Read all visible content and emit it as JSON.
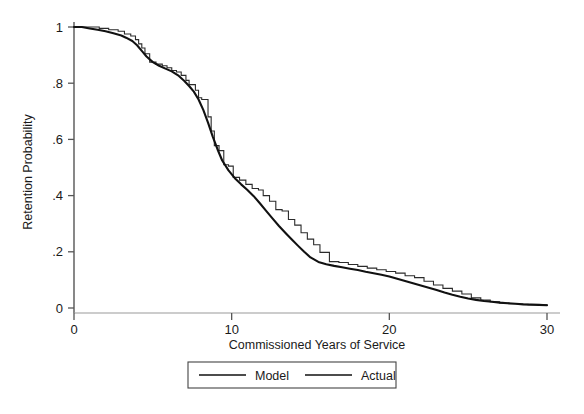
{
  "chart_data": {
    "type": "line",
    "title": "",
    "subtitle": "",
    "xlabel": "Commissioned Years of Service",
    "ylabel": "Retention Probability",
    "xlim": [
      0,
      30
    ],
    "ylim": [
      0,
      1
    ],
    "xticks": [
      0,
      10,
      20,
      30
    ],
    "xticklabels": [
      "0",
      "10",
      "20",
      "30"
    ],
    "yticks": [
      0,
      0.2,
      0.4,
      0.6,
      0.8,
      1
    ],
    "yticklabels": [
      "0",
      ".2",
      ".4",
      ".6",
      ".8",
      "1"
    ],
    "grid": false,
    "legend_position": "below-axes",
    "line_color": "#1a1a1a",
    "legend": [
      {
        "name": "Model",
        "color": "#1a1a1a"
      },
      {
        "name": "Actual",
        "color": "#1a1a1a"
      }
    ],
    "series": [
      {
        "name": "Model",
        "drawstyle": "smooth",
        "x": [
          0.0,
          0.5,
          1.0,
          1.5,
          2.0,
          2.5,
          3.0,
          3.3,
          3.7,
          4.0,
          4.3,
          4.6,
          5.0,
          5.4,
          5.8,
          6.2,
          6.6,
          7.0,
          7.3,
          7.6,
          7.9,
          8.2,
          8.5,
          8.8,
          9.1,
          9.4,
          9.8,
          10.2,
          10.6,
          11.0,
          11.4,
          11.8,
          12.2,
          12.6,
          13.0,
          13.4,
          13.8,
          14.2,
          14.6,
          15.0,
          15.5,
          16.0,
          16.5,
          17.0,
          17.5,
          18.0,
          18.5,
          19.0,
          19.5,
          20.0,
          20.5,
          21.0,
          21.5,
          22.0,
          22.5,
          23.0,
          23.5,
          24.0,
          24.5,
          25.0,
          25.5,
          26.0,
          26.5,
          27.0,
          27.5,
          28.0,
          28.5,
          29.0,
          29.5,
          30.0
        ],
        "y": [
          1.0,
          1.0,
          0.995,
          0.99,
          0.985,
          0.978,
          0.97,
          0.962,
          0.95,
          0.935,
          0.915,
          0.895,
          0.875,
          0.862,
          0.852,
          0.842,
          0.828,
          0.808,
          0.79,
          0.77,
          0.742,
          0.705,
          0.66,
          0.61,
          0.565,
          0.525,
          0.49,
          0.462,
          0.44,
          0.42,
          0.398,
          0.372,
          0.345,
          0.318,
          0.292,
          0.268,
          0.245,
          0.222,
          0.2,
          0.18,
          0.164,
          0.156,
          0.15,
          0.145,
          0.14,
          0.135,
          0.129,
          0.124,
          0.118,
          0.112,
          0.104,
          0.096,
          0.088,
          0.08,
          0.072,
          0.064,
          0.055,
          0.047,
          0.04,
          0.034,
          0.029,
          0.025,
          0.022,
          0.019,
          0.017,
          0.015,
          0.013,
          0.012,
          0.011,
          0.01
        ]
      },
      {
        "name": "Actual",
        "drawstyle": "steps-post",
        "x": [
          0.0,
          1.0,
          1.6,
          2.2,
          2.8,
          3.2,
          3.6,
          3.9,
          4.1,
          4.3,
          4.5,
          4.8,
          5.2,
          5.6,
          5.9,
          6.2,
          6.5,
          6.8,
          7.1,
          7.3,
          7.5,
          7.7,
          7.9,
          8.1,
          8.3,
          8.5,
          8.7,
          8.9,
          9.2,
          9.5,
          9.8,
          10.1,
          10.5,
          10.9,
          11.3,
          11.7,
          12.0,
          12.4,
          12.8,
          13.2,
          13.6,
          14.0,
          14.4,
          14.8,
          15.2,
          15.6,
          16.2,
          16.8,
          17.4,
          18.0,
          18.6,
          19.2,
          19.8,
          20.4,
          21.0,
          21.6,
          22.2,
          22.8,
          23.4,
          24.0,
          24.6,
          25.2,
          25.8,
          26.4,
          27.0,
          27.6,
          28.2,
          28.8,
          29.4,
          30.0
        ],
        "y": [
          1.0,
          1.0,
          0.995,
          0.99,
          0.985,
          0.975,
          0.968,
          0.955,
          0.94,
          0.925,
          0.905,
          0.875,
          0.868,
          0.862,
          0.855,
          0.845,
          0.84,
          0.828,
          0.81,
          0.795,
          0.795,
          0.775,
          0.748,
          0.742,
          0.742,
          0.68,
          0.63,
          0.578,
          0.56,
          0.51,
          0.505,
          0.465,
          0.455,
          0.44,
          0.425,
          0.42,
          0.4,
          0.38,
          0.35,
          0.345,
          0.315,
          0.295,
          0.268,
          0.245,
          0.225,
          0.198,
          0.165,
          0.162,
          0.155,
          0.148,
          0.142,
          0.136,
          0.13,
          0.124,
          0.115,
          0.108,
          0.095,
          0.082,
          0.07,
          0.06,
          0.05,
          0.036,
          0.028,
          0.022,
          0.018,
          0.015,
          0.013,
          0.012,
          0.011,
          0.01
        ]
      }
    ]
  },
  "axes": {
    "x_axis_label": "Commissioned Years of Service",
    "y_axis_label": "Retention Probability"
  },
  "legend_box": {
    "model_label": "Model",
    "actual_label": "Actual"
  }
}
